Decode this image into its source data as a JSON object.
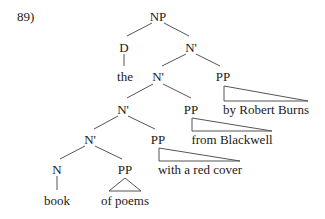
{
  "example_number": "89)",
  "tree": {
    "nodes": {
      "np": "NP",
      "d": "D",
      "nbar1": "N'",
      "the": "the",
      "nbar2": "N'",
      "pp1": "PP",
      "nbar3": "N'",
      "pp2": "PP",
      "nbar4": "N'",
      "pp3": "PP",
      "n": "N",
      "pp4": "PP",
      "book": "book"
    },
    "phrases": {
      "pp1_text": "by Robert Burns",
      "pp2_text": "from Blackwell",
      "pp3_text": "with a red cover",
      "pp4_text": "of poems"
    }
  }
}
